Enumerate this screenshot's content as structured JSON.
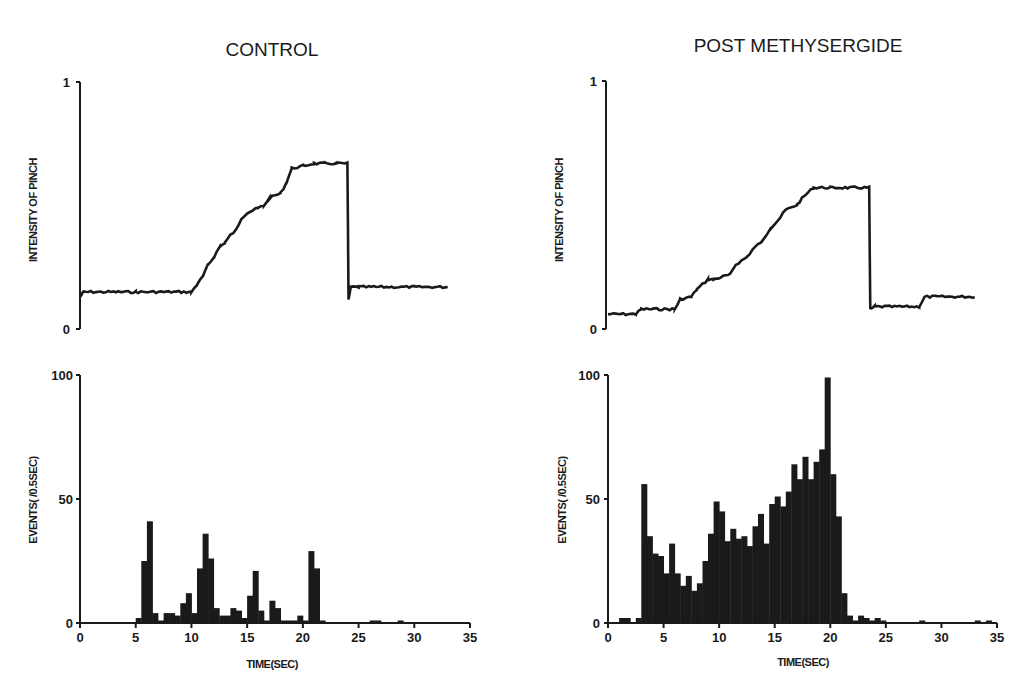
{
  "figure": {
    "left_title": "CONTROL",
    "right_title": "POST METHYSERGIDE",
    "trace_ylabel": "INTENSITY OF PINCH",
    "hist_ylabel": "EVENTS( /0.5SEC)",
    "xlabel": "TIME(SEC)",
    "trace_yticks": [
      "0",
      "1"
    ],
    "hist_yticks": [
      "0",
      "50",
      "100"
    ],
    "xticks": [
      "0",
      "5",
      "10",
      "15",
      "20",
      "25",
      "30",
      "35"
    ]
  },
  "colors": {
    "ink": "#1a1a1a",
    "background": "#ffffff"
  },
  "chart_data": [
    {
      "type": "line",
      "panel": "control-trace",
      "title": "CONTROL",
      "xlabel": "",
      "ylabel": "INTENSITY OF PINCH",
      "ylim": [
        0,
        1
      ],
      "xlim": [
        0,
        35
      ],
      "x": [
        0,
        0.3,
        5,
        10,
        10.5,
        11,
        11.5,
        12,
        12.5,
        13,
        13.5,
        14,
        14.5,
        15,
        16,
        16.5,
        17,
        18,
        18.5,
        19,
        20,
        21,
        22,
        23,
        24,
        24.1,
        24.3,
        25,
        30,
        33
      ],
      "y": [
        0.13,
        0.15,
        0.15,
        0.15,
        0.18,
        0.21,
        0.26,
        0.29,
        0.33,
        0.35,
        0.38,
        0.4,
        0.45,
        0.47,
        0.49,
        0.5,
        0.53,
        0.55,
        0.59,
        0.65,
        0.66,
        0.67,
        0.67,
        0.67,
        0.67,
        0.12,
        0.17,
        0.17,
        0.17,
        0.17
      ],
      "grid": false
    },
    {
      "type": "bar",
      "panel": "control-histogram",
      "title": "CONTROL",
      "xlabel": "TIME(SEC)",
      "ylabel": "EVENTS( /0.5SEC)",
      "ylim": [
        0,
        100
      ],
      "xlim": [
        0,
        35
      ],
      "bin_width": 0.5,
      "x": [
        5.0,
        5.5,
        6.0,
        6.5,
        7.0,
        7.5,
        8.0,
        8.5,
        9.0,
        9.5,
        10.0,
        10.5,
        11.0,
        11.5,
        12.0,
        12.5,
        13.0,
        13.5,
        14.0,
        14.5,
        15.0,
        15.5,
        16.0,
        16.5,
        17.0,
        17.5,
        18.0,
        18.5,
        19.0,
        19.5,
        20.0,
        20.5,
        21.0,
        21.5,
        26.0,
        26.5,
        28.5
      ],
      "values": [
        2,
        25,
        41,
        4,
        1,
        4,
        4,
        3,
        8,
        12,
        4,
        22,
        36,
        26,
        6,
        3,
        3,
        6,
        5,
        2,
        11,
        21,
        5,
        1,
        9,
        6,
        1,
        1,
        1,
        3,
        1,
        29,
        22,
        1,
        1,
        1,
        1
      ],
      "grid": false
    },
    {
      "type": "line",
      "panel": "methysergide-trace",
      "title": "POST METHYSERGIDE",
      "xlabel": "",
      "ylabel": "INTENSITY OF PINCH",
      "ylim": [
        0,
        1
      ],
      "xlim": [
        0,
        35
      ],
      "x": [
        0,
        2.5,
        3,
        6,
        6.5,
        7.5,
        8,
        9,
        9.5,
        11,
        11.5,
        12.5,
        13,
        14,
        14.5,
        15.5,
        16,
        17,
        17.5,
        18.5,
        19,
        20,
        22,
        23.5,
        23.6,
        24,
        28,
        28.5,
        33
      ],
      "y": [
        0.06,
        0.06,
        0.08,
        0.08,
        0.12,
        0.13,
        0.16,
        0.2,
        0.2,
        0.22,
        0.26,
        0.29,
        0.32,
        0.36,
        0.4,
        0.45,
        0.48,
        0.5,
        0.53,
        0.57,
        0.57,
        0.57,
        0.57,
        0.57,
        0.08,
        0.09,
        0.09,
        0.13,
        0.13
      ],
      "grid": false
    },
    {
      "type": "bar",
      "panel": "methysergide-histogram",
      "title": "POST METHYSERGIDE",
      "xlabel": "TIME(SEC)",
      "ylabel": "EVENTS( /0.5SEC)",
      "ylim": [
        0,
        100
      ],
      "xlim": [
        0,
        35
      ],
      "bin_width": 0.5,
      "x": [
        1.0,
        1.5,
        2.5,
        3.0,
        3.5,
        4.0,
        4.5,
        5.0,
        5.5,
        6.0,
        6.5,
        7.0,
        7.5,
        8.0,
        8.5,
        9.0,
        9.5,
        10.0,
        10.5,
        11.0,
        11.5,
        12.0,
        12.5,
        13.0,
        13.5,
        14.0,
        14.5,
        15.0,
        15.5,
        16.0,
        16.5,
        17.0,
        17.5,
        18.0,
        18.5,
        19.0,
        19.5,
        20.0,
        20.5,
        21.0,
        21.5,
        22.0,
        22.5,
        23.0,
        23.5,
        24.0,
        24.5,
        28.0,
        33.0,
        34.0
      ],
      "values": [
        2,
        2,
        2,
        56,
        35,
        28,
        27,
        20,
        32,
        20,
        15,
        19,
        13,
        16,
        25,
        36,
        49,
        45,
        33,
        38,
        34,
        35,
        31,
        39,
        44,
        32,
        48,
        51,
        47,
        53,
        64,
        58,
        67,
        58,
        65,
        70,
        99,
        60,
        43,
        12,
        3,
        1,
        3,
        2,
        1,
        2,
        1,
        1,
        1,
        1
      ],
      "grid": false
    }
  ]
}
